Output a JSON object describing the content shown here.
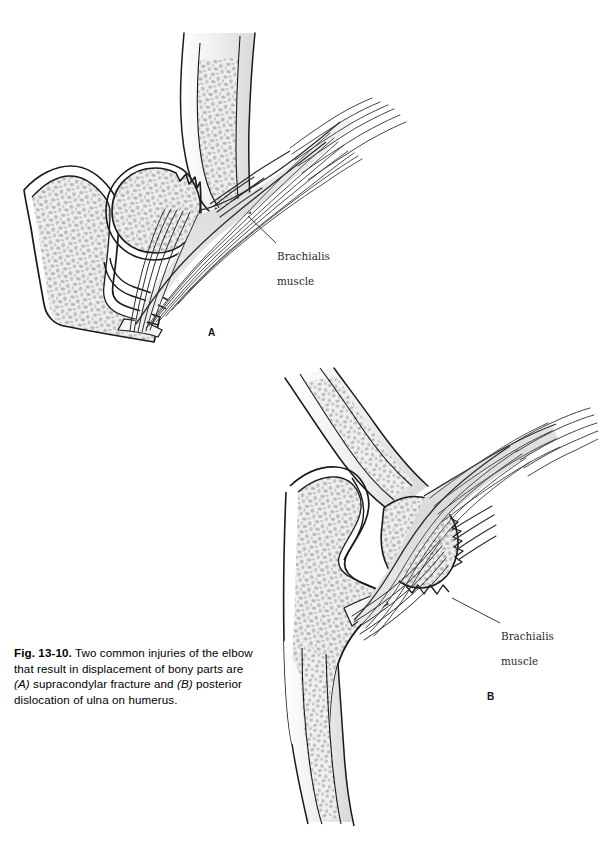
{
  "page": {
    "background_color": "#ffffff",
    "width": 598,
    "height": 844
  },
  "figure": {
    "number": "Fig. 13-10.",
    "caption_parts": {
      "lead": "Fig. 13-10.",
      "text_1": "  Two common injuries of the elbow that result in displacement of bony parts are ",
      "marker_a": "(A)",
      "text_2": " supracondylar fracture and ",
      "marker_b": "(B)",
      "text_3": " posterior dislocation of ulna on humerus."
    },
    "caption_full": "Fig. 13-10. Two common injuries of the elbow that result in displacement of bony parts are (A) supracondylar fracture and (B) posterior dislocation of ulna on humerus."
  },
  "panels": [
    {
      "letter": "A",
      "name": "supracondylar-fracture",
      "label": {
        "text": "Brachialis\nmuscle",
        "line1": "Brachialis",
        "line2": "muscle"
      }
    },
    {
      "letter": "B",
      "name": "posterior-dislocation",
      "label": {
        "text": "Brachialis\nmuscle",
        "line1": "Brachialis",
        "line2": "muscle"
      }
    }
  ],
  "style": {
    "ink": "#1a1a1a",
    "bone_cortex": "#ededed",
    "bone_cortex_edge": "#dcdcdc",
    "marrow_fill": "#efefef",
    "stipple": "#b8b8b8",
    "muscle_fill": "#e4e4e4",
    "muscle_line": "#3a3a3a",
    "leader_line": "#3a3a3a",
    "label_text": "#2a2a2a",
    "caption_text": "#000000"
  }
}
